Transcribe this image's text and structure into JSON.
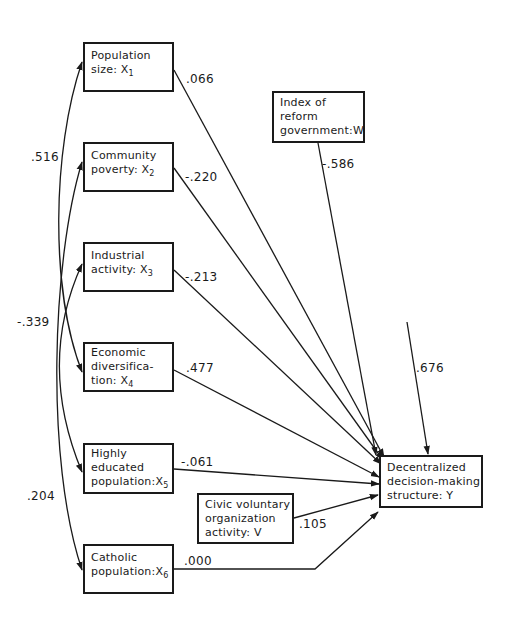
{
  "diagram": {
    "type": "path-diagram",
    "nodes": {
      "x1": {
        "lines": [
          "Population",
          "size:  X"
        ],
        "sub": "1"
      },
      "x2": {
        "lines": [
          "Community",
          "poverty: X"
        ],
        "sub": "2"
      },
      "x3": {
        "lines": [
          "Industrial",
          "activity: X"
        ],
        "sub": "3"
      },
      "x4": {
        "lines": [
          "Economic",
          "diversifica-",
          "tion: X"
        ],
        "sub": "4"
      },
      "x5": {
        "lines": [
          "Highly",
          "educated",
          "population:X"
        ],
        "sub": "5"
      },
      "x6": {
        "lines": [
          "Catholic",
          "population:X"
        ],
        "sub": "6"
      },
      "w": {
        "lines": [
          "Index of",
          "reform",
          "government:W"
        ]
      },
      "v": {
        "lines": [
          "Civic voluntary",
          "organization",
          "activity:  V"
        ]
      },
      "y": {
        "lines": [
          "Decentralized",
          "decision-making",
          "structure:  Y"
        ]
      }
    },
    "paths": {
      "x1_y": ".066",
      "x2_y": "-.220",
      "x3_y": "-.213",
      "x4_y": ".477",
      "x5_y": "-.061",
      "x6_y": ".000",
      "w_y": "-.586",
      "v_y": ".105",
      "residual_y": ".676"
    },
    "correlations": {
      "x1_x4": ".516",
      "x3_x5": "-.339",
      "x2_x6": ".204"
    }
  }
}
